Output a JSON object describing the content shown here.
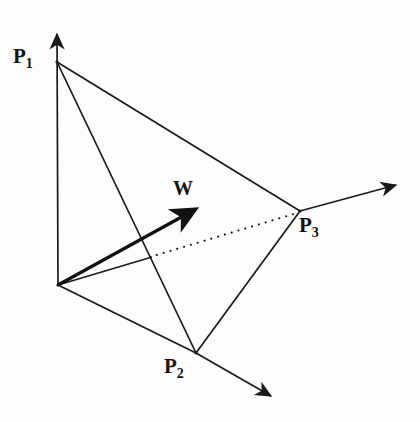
{
  "figure": {
    "background_color": "#fdfdfc",
    "stroke_color": "#1a1a1a"
  },
  "labels": {
    "p1": {
      "base": "P",
      "sub": "1"
    },
    "p2": {
      "base": "P",
      "sub": "2"
    },
    "p3": {
      "base": "P",
      "sub": "3"
    },
    "w": {
      "base": "W",
      "sub": ""
    }
  },
  "geometry": {
    "origin": {
      "x": 58,
      "y": 285
    },
    "vertices": {
      "p1": {
        "x": 57,
        "y": 62
      },
      "p2": {
        "x": 196,
        "y": 353
      },
      "p3": {
        "x": 300,
        "y": 211
      }
    },
    "axis_arrow_tips": {
      "up": {
        "x": 57,
        "y": 29
      },
      "right": {
        "x": 401,
        "y": 183
      },
      "down_right": {
        "x": 276,
        "y": 400
      }
    },
    "vector_w": {
      "from": {
        "x": 58,
        "y": 285
      },
      "to": {
        "x": 201,
        "y": 206
      }
    },
    "dotted_edge": {
      "from": {
        "x": 150,
        "y": 257
      },
      "to": {
        "x": 297,
        "y": 213
      }
    },
    "short_edge_origin_to_dotted": {
      "from": {
        "x": 58,
        "y": 285
      },
      "to": {
        "x": 152,
        "y": 257
      }
    }
  }
}
